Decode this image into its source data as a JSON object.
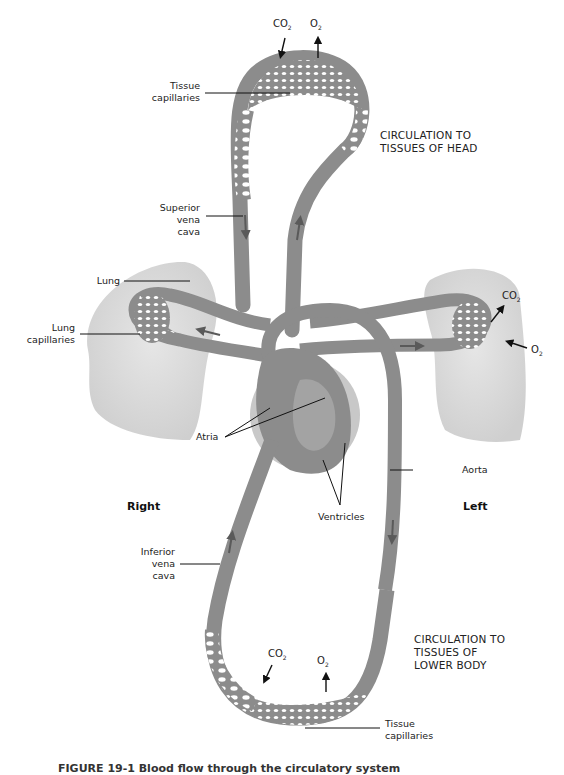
{
  "figure": {
    "caption": "FIGURE 19-1 Blood flow through the circulatory system",
    "side_labels": {
      "right": "Right",
      "left": "Left"
    },
    "region_labels": {
      "head": [
        "CIRCULATION TO",
        "TISSUES OF HEAD"
      ],
      "lower_body": [
        "CIRCULATION TO",
        "TISSUES OF",
        "LOWER BODY"
      ]
    },
    "structure_labels": {
      "head_tissue_capillaries": [
        "Tissue",
        "capillaries"
      ],
      "superior_vena_cava": [
        "Superior",
        "vena",
        "cava"
      ],
      "lung": "Lung",
      "lung_capillaries": [
        "Lung",
        "capillaries"
      ],
      "atria": "Atria",
      "ventricles": "Ventricles",
      "aorta": "Aorta",
      "inferior_vena_cava": [
        "Inferior",
        "vena",
        "cava"
      ],
      "lower_tissue_capillaries": [
        "Tissue",
        "capillaries"
      ]
    },
    "gas_labels": {
      "head_co2": {
        "main": "CO",
        "sub": "2"
      },
      "head_o2": {
        "main": "O",
        "sub": "2"
      },
      "lung_co2": {
        "main": "CO",
        "sub": "2"
      },
      "lung_o2": {
        "main": "O",
        "sub": "2"
      },
      "lower_co2": {
        "main": "CO",
        "sub": "2"
      },
      "lower_o2": {
        "main": "O",
        "sub": "2"
      }
    },
    "colors": {
      "vessel": "#8c8c8c",
      "vessel_dark": "#6e6e6e",
      "lung": "#dcdcdc",
      "heart_outer": "#c4c4c4",
      "capillary_hole": "#ffffff",
      "text": "#222222"
    }
  }
}
